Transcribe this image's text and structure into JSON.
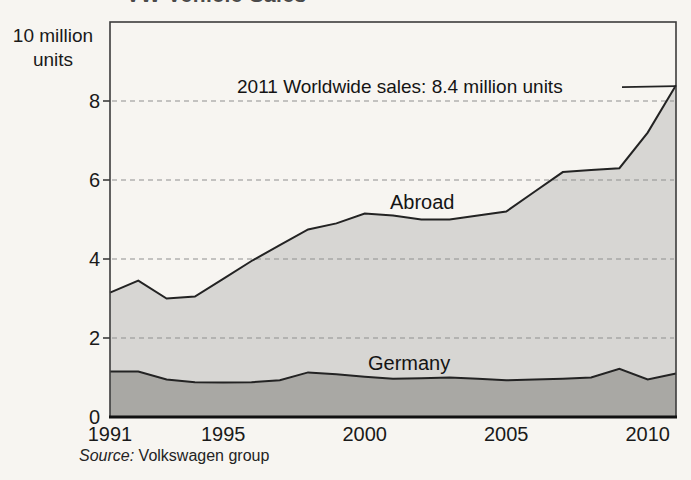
{
  "page": {
    "clipped_title": "VW Vehicle Sales",
    "source_prefix": "Source:",
    "source_text": " Volkswagen group"
  },
  "chart_data": {
    "type": "area",
    "title": "VW Vehicle Sales",
    "subtitle_annotation": "2011 Worldwide sales: 8.4 million units",
    "xlabel": "",
    "ylabel": "10 million units",
    "y_axis_title_line1": "10 million",
    "y_axis_title_line2": "units",
    "units": "million units",
    "stacked": true,
    "grid": "dashed horizontal at 2,4,6,8",
    "legend_position": "labels inside areas",
    "ylim": [
      0,
      10
    ],
    "y_ticks": [
      0,
      2,
      4,
      6,
      8
    ],
    "x_tick_years": [
      1991,
      1995,
      2000,
      2005,
      2010
    ],
    "x": [
      1991,
      1992,
      1993,
      1994,
      1995,
      1996,
      1997,
      1998,
      1999,
      2000,
      2001,
      2002,
      2003,
      2004,
      2005,
      2006,
      2007,
      2008,
      2009,
      2010,
      2011
    ],
    "series": [
      {
        "name": "Germany",
        "values": [
          1.15,
          1.15,
          0.95,
          0.88,
          0.87,
          0.88,
          0.93,
          1.13,
          1.08,
          1.02,
          0.97,
          0.98,
          1.0,
          0.97,
          0.93,
          0.95,
          0.97,
          1.0,
          1.22,
          0.95,
          1.1
        ]
      },
      {
        "name": "Abroad",
        "values": [
          2.0,
          2.3,
          2.05,
          2.17,
          2.63,
          3.07,
          3.42,
          3.62,
          3.82,
          4.13,
          4.13,
          4.02,
          4.0,
          4.13,
          4.27,
          4.75,
          5.23,
          5.25,
          5.08,
          6.25,
          7.3
        ]
      }
    ],
    "worldwide_total": [
      3.15,
      3.45,
      3.0,
      3.05,
      3.5,
      3.95,
      4.35,
      4.75,
      4.9,
      5.15,
      5.1,
      5.0,
      5.0,
      5.1,
      5.2,
      5.7,
      6.2,
      6.25,
      6.3,
      7.2,
      8.4
    ],
    "colors": {
      "germany_fill": "#a9a8a4",
      "abroad_fill": "#d7d6d3",
      "line": "#232323",
      "grid": "#8f8f8f",
      "border": "#3c3c3c",
      "paper": "#f7f5f1"
    }
  }
}
